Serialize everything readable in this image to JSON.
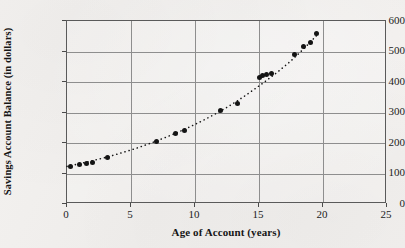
{
  "chart_data": {
    "type": "scatter",
    "title": "",
    "xlabel": "Age of Account (years)",
    "ylabel": "Savings Account Balance (in dollars)",
    "xlim": [
      0,
      25
    ],
    "ylim": [
      0,
      600
    ],
    "xticks": [
      0,
      5,
      10,
      15,
      20,
      25
    ],
    "yticks": [
      0,
      100,
      200,
      300,
      400,
      500,
      600
    ],
    "xtick_labels": [
      "0",
      "5",
      "10",
      "15",
      "20",
      "25"
    ],
    "ytick_labels": [
      "0",
      "100",
      "200",
      "300",
      "400",
      "500",
      "600"
    ],
    "grid": true,
    "legend": "none",
    "marker": "filled-circle",
    "trend_line": {
      "style": "dotted",
      "description": "exponential growth curve fitted through the points"
    },
    "x": [
      0.3,
      1.0,
      1.5,
      2.0,
      3.2,
      7.0,
      8.5,
      9.2,
      12.0,
      13.3,
      15.0,
      15.3,
      15.6,
      16.0,
      17.8,
      18.5,
      19.0,
      19.5
    ],
    "y": [
      122,
      128,
      132,
      137,
      153,
      205,
      232,
      240,
      305,
      330,
      415,
      420,
      425,
      428,
      490,
      515,
      530,
      560
    ],
    "points": [
      {
        "x": 0.3,
        "y": 122
      },
      {
        "x": 1.0,
        "y": 128
      },
      {
        "x": 1.5,
        "y": 132
      },
      {
        "x": 2.0,
        "y": 137
      },
      {
        "x": 3.2,
        "y": 153
      },
      {
        "x": 7.0,
        "y": 205
      },
      {
        "x": 8.5,
        "y": 232
      },
      {
        "x": 9.2,
        "y": 240
      },
      {
        "x": 12.0,
        "y": 305
      },
      {
        "x": 13.3,
        "y": 330
      },
      {
        "x": 15.0,
        "y": 415
      },
      {
        "x": 15.3,
        "y": 420
      },
      {
        "x": 15.6,
        "y": 425
      },
      {
        "x": 16.0,
        "y": 428
      },
      {
        "x": 17.8,
        "y": 490
      },
      {
        "x": 18.5,
        "y": 515
      },
      {
        "x": 19.0,
        "y": 530
      },
      {
        "x": 19.5,
        "y": 560
      }
    ],
    "trend_points": [
      {
        "x": 0.0,
        "y": 118
      },
      {
        "x": 2.5,
        "y": 142
      },
      {
        "x": 5.0,
        "y": 172
      },
      {
        "x": 7.5,
        "y": 210
      },
      {
        "x": 10.0,
        "y": 256
      },
      {
        "x": 12.5,
        "y": 312
      },
      {
        "x": 15.0,
        "y": 382
      },
      {
        "x": 17.5,
        "y": 464
      },
      {
        "x": 19.8,
        "y": 560
      }
    ]
  },
  "colors": {
    "marker": "#141414",
    "trend": "#141414",
    "grid": "#8e8e8e",
    "frame": "#5a5a5a",
    "text": "#161616",
    "paper": "#f2f0ee"
  }
}
